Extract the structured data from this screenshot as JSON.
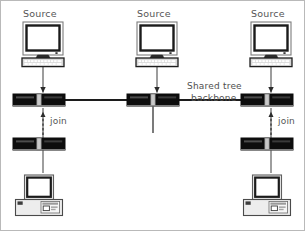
{
  "diagram": {
    "background_color": "#ffffff",
    "border_color": "#b9b9b9",
    "line_color": "#4a4a4a",
    "device_fill": "#111111",
    "text_color": "#555555"
  },
  "labels": {
    "source_left": "Source",
    "source_center": "Source",
    "source_right": "Source",
    "backbone_line1": "Shared tree",
    "backbone_line2": "backbone",
    "join_left": "join",
    "join_right": "join"
  },
  "nodes": {
    "sources": [
      {
        "id": "source-left",
        "label": "Source",
        "x": 42,
        "y": 45
      },
      {
        "id": "source-center",
        "label": "Source",
        "x": 156,
        "y": 45
      },
      {
        "id": "source-right",
        "label": "Source",
        "x": 270,
        "y": 45
      }
    ],
    "routers": [
      {
        "id": "router-left-backbone",
        "x": 38,
        "y": 99
      },
      {
        "id": "router-center-backbone",
        "x": 152,
        "y": 99
      },
      {
        "id": "router-right-backbone",
        "x": 266,
        "y": 99
      },
      {
        "id": "router-left-leaf",
        "x": 38,
        "y": 143
      },
      {
        "id": "router-right-leaf",
        "x": 266,
        "y": 143
      }
    ],
    "receivers": [
      {
        "id": "receiver-left",
        "x": 38,
        "y": 192
      },
      {
        "id": "receiver-right",
        "x": 266,
        "y": 192
      }
    ]
  },
  "edges": {
    "backbone_segments": [
      {
        "from": "router-left-backbone",
        "to": "router-center-backbone"
      },
      {
        "from": "router-center-backbone",
        "to": "router-right-backbone"
      }
    ],
    "source_feeds": [
      {
        "from": "source-left",
        "to": "router-left-backbone",
        "style": "solid-arrow"
      },
      {
        "from": "source-center",
        "to": "router-center-backbone",
        "style": "solid-arrow"
      },
      {
        "from": "source-right",
        "to": "router-right-backbone",
        "style": "solid-arrow"
      }
    ],
    "join_messages": [
      {
        "from": "router-left-leaf",
        "to": "router-left-backbone",
        "style": "dashed-arrow",
        "label": "join"
      },
      {
        "from": "router-right-leaf",
        "to": "router-right-backbone",
        "style": "dashed-arrow",
        "label": "join"
      }
    ],
    "receiver_links": [
      {
        "from": "receiver-left",
        "to": "router-left-leaf",
        "style": "plain"
      },
      {
        "from": "receiver-right",
        "to": "router-right-leaf",
        "style": "plain"
      }
    ],
    "center_stub": {
      "from": "router-center-backbone",
      "style": "plain-down"
    }
  }
}
